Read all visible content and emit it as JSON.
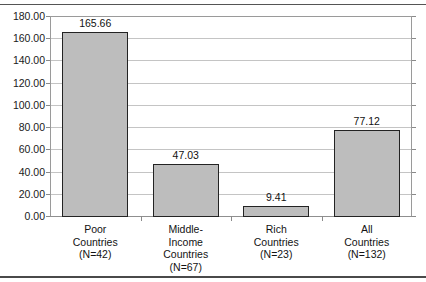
{
  "chart_data": {
    "type": "bar",
    "title": "",
    "subtitle": "",
    "xlabel": "",
    "ylabel": "",
    "categories": [
      "Poor\nCountries\n(N=42)",
      "Middle-\nIncome\nCountries\n(N=67)",
      "Rich\nCountries\n(N=23)",
      "All\nCountries\n(N=132)"
    ],
    "category_lines": [
      [
        "Poor",
        "Countries",
        "(N=42)"
      ],
      [
        "Middle-",
        "Income",
        "Countries",
        "(N=67)"
      ],
      [
        "Rich",
        "Countries",
        "(N=23)"
      ],
      [
        "All",
        "Countries",
        "(N=132)"
      ]
    ],
    "values": [
      165.66,
      9.41,
      47.03,
      77.12
    ],
    "ordered_values": [
      165.66,
      47.03,
      9.41,
      77.12
    ],
    "value_labels": [
      "165.66",
      "47.03",
      "9.41",
      "77.12"
    ],
    "ylim": [
      0,
      180
    ],
    "ytick_values": [
      0,
      20,
      40,
      60,
      80,
      100,
      120,
      140,
      160,
      180
    ],
    "ytick_labels": [
      "0.00",
      "20.00",
      "40.00",
      "60.00",
      "80.00",
      "100.00",
      "120.00",
      "140.00",
      "160.00",
      "180.00"
    ],
    "grid": true,
    "grid_axis": "y",
    "legend": false,
    "legend_position": "none",
    "bar_fill_color": "#bdbdbd",
    "bar_border_color": "#232323",
    "gridline_color": "#c4c4c4",
    "axis_color": "#8f8f8f",
    "text_color": "#131313",
    "background_color": "#ffffff"
  }
}
